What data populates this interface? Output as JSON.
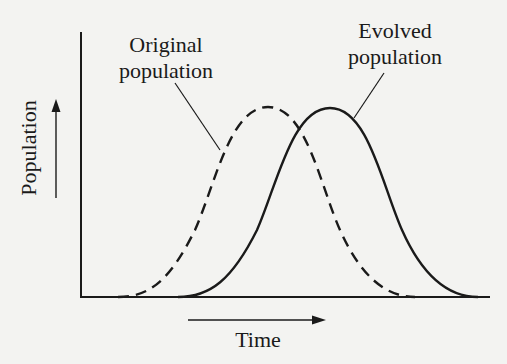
{
  "diagram": {
    "type": "population-distribution-shift",
    "labels": {
      "original": [
        "Original",
        "population"
      ],
      "evolved": [
        "Evolved",
        "population"
      ],
      "y_axis": "Population",
      "x_axis": "Time"
    },
    "curves": [
      {
        "name": "Original population",
        "style": "dashed",
        "start_x": 133,
        "peak_x": 268,
        "peak_y": 107,
        "end_x": 410
      },
      {
        "name": "Evolved population",
        "style": "solid",
        "start_x": 193,
        "peak_x": 330,
        "peak_y": 108,
        "end_x": 475
      }
    ],
    "colors": {
      "ink": "#1a1a1a",
      "background": "#f3f3f1"
    }
  }
}
